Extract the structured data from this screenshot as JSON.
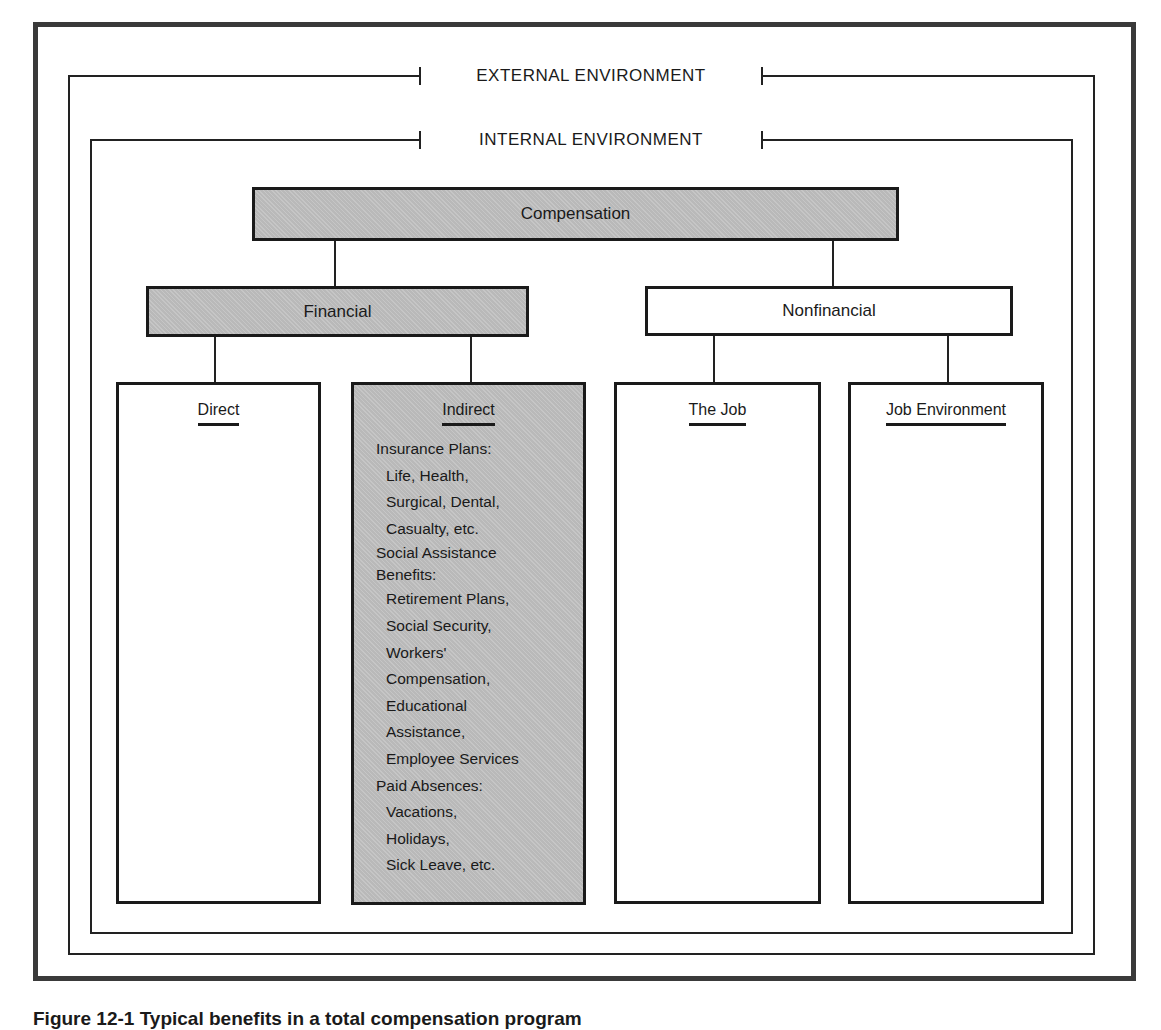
{
  "environment": {
    "external_label": "EXTERNAL ENVIRONMENT",
    "internal_label": "INTERNAL ENVIRONMENT"
  },
  "tree": {
    "root": {
      "label": "Compensation",
      "shaded": true
    },
    "financial": {
      "label": "Financial",
      "shaded": true
    },
    "nonfinancial": {
      "label": "Nonfinancial",
      "shaded": false
    },
    "columns": {
      "direct": {
        "title": "Direct",
        "shaded": false,
        "items": []
      },
      "indirect": {
        "title": "Indirect",
        "shaded": true,
        "groups": [
          {
            "heading": "Insurance Plans:",
            "lines": [
              "Life, Health,",
              "Surgical, Dental,",
              "Casualty, etc."
            ]
          },
          {
            "heading": "Social Assistance",
            "heading2": "Benefits:",
            "lines": [
              "Retirement Plans,",
              "Social Security,",
              "Workers'",
              "Compensation,",
              "Educational",
              "Assistance,",
              "Employee Services"
            ]
          },
          {
            "heading": "Paid Absences:",
            "lines": [
              "Vacations,",
              "Holidays,",
              "Sick Leave, etc."
            ]
          }
        ]
      },
      "the_job": {
        "title": "The Job",
        "shaded": false,
        "items": []
      },
      "job_environment": {
        "title": "Job Environment",
        "shaded": false,
        "items": []
      }
    }
  },
  "caption": "Figure 12-1  Typical benefits in a total compensation program",
  "colors": {
    "shaded_fill": "#b9b9b9",
    "line": "#1a1a1a",
    "frame": "#3a3a3a"
  }
}
